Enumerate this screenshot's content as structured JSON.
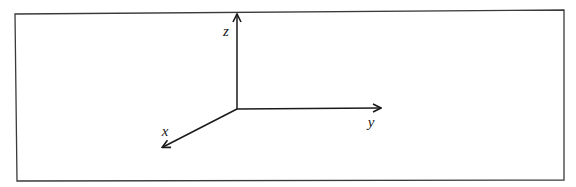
{
  "diagram": {
    "type": "3d-coordinate-axes",
    "colors": {
      "background": "#ffffff",
      "frame": "#3a3a3a",
      "axis": "#1a1a1a",
      "label": "#1a1a1a"
    },
    "frame": {
      "top_left": [
        15,
        12
      ],
      "bottom_right": [
        564,
        180
      ]
    },
    "origin": [
      237,
      109
    ],
    "axes": [
      {
        "name": "z",
        "label": "z",
        "tip": [
          237,
          14
        ],
        "label_pos": [
          226,
          36
        ]
      },
      {
        "name": "y",
        "label": "y",
        "tip": [
          381,
          108
        ],
        "label_pos": [
          371,
          127
        ]
      },
      {
        "name": "x",
        "label": "x",
        "tip": [
          162,
          148
        ],
        "label_pos": [
          165,
          136
        ]
      }
    ]
  }
}
